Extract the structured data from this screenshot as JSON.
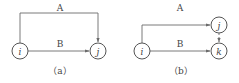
{
  "panels": [
    {
      "caption": "（a）",
      "nodes": [
        {
          "id": "i",
          "label": "i"
        },
        {
          "id": "j",
          "label": "j"
        }
      ],
      "edges": [
        {
          "from": "i",
          "to": "j",
          "label": "A",
          "style": "solid"
        },
        {
          "from": "i",
          "to": "j",
          "label": "B",
          "style": "solid"
        }
      ]
    },
    {
      "caption": "（b）",
      "nodes": [
        {
          "id": "i",
          "label": "i"
        },
        {
          "id": "j",
          "label": "j"
        },
        {
          "id": "k",
          "label": "k"
        }
      ],
      "edges": [
        {
          "from": "i",
          "to": "j",
          "label": "A",
          "style": "solid"
        },
        {
          "from": "i",
          "to": "k",
          "label": "B",
          "style": "solid"
        },
        {
          "from": "j",
          "to": "k",
          "label": "",
          "style": "dashed"
        }
      ]
    }
  ],
  "colors": {
    "stroke": "#6b6b6b",
    "text": "#444444",
    "background": "#ffffff"
  }
}
